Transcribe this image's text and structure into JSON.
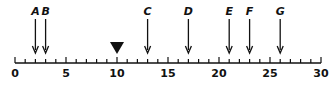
{
  "number_line": {
    "min": 0,
    "max": 30,
    "major_ticks": [
      "0",
      "5",
      "10",
      "15",
      "20",
      "25",
      "30"
    ],
    "minor_step": 1
  },
  "arrows": [
    {
      "label": "A",
      "value": 2
    },
    {
      "label": "B",
      "value": 3
    },
    {
      "label": "C",
      "value": 13
    },
    {
      "label": "D",
      "value": 17
    },
    {
      "label": "E",
      "value": 21
    },
    {
      "label": "F",
      "value": 23
    },
    {
      "label": "G",
      "value": 26
    }
  ],
  "marker": {
    "shape": "triangle-down",
    "value": 10
  },
  "colors": {
    "ink": "#111111"
  }
}
